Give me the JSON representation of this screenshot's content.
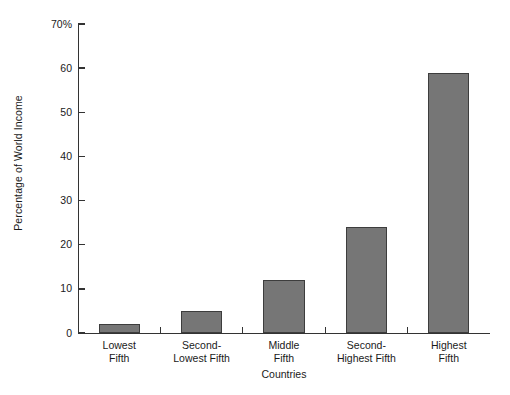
{
  "chart_data": {
    "type": "bar",
    "title": "",
    "subtitle": "",
    "xlabel": "Countries",
    "ylabel": "Percentage of World Income",
    "categories": [
      "Lowest\nFifth",
      "Second-\nLowest Fifth",
      "Middle\nFifth",
      "Second-\nHighest Fifth",
      "Highest\nFifth"
    ],
    "category_lines": [
      [
        "Lowest",
        "Fifth"
      ],
      [
        "Second-",
        "Lowest Fifth"
      ],
      [
        "Middle",
        "Fifth"
      ],
      [
        "Second-",
        "Highest Fifth"
      ],
      [
        "Highest",
        "Fifth"
      ]
    ],
    "values": [
      2,
      5,
      12,
      24,
      59
    ],
    "ylim": [
      0,
      70
    ],
    "yticks": [
      0,
      10,
      20,
      30,
      40,
      50,
      60,
      70
    ],
    "ytick_labels": [
      "0",
      "10",
      "20",
      "30",
      "40",
      "50",
      "60",
      "70%"
    ],
    "grid": false,
    "legend": null,
    "bar_color": "#767676",
    "bar_edge_color": "#3d3d3d",
    "axis_color": "#333333",
    "text_color": "#1a1a1a",
    "background_color": "#ffffff"
  }
}
